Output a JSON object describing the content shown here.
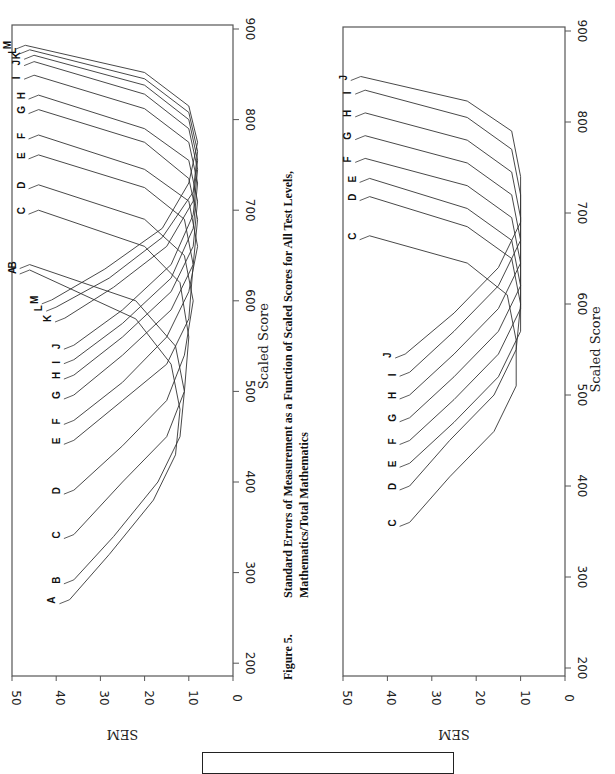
{
  "caption": {
    "figure_label": "Figure 5.",
    "line1": "Standard Errors of Measurement as a Function of Scaled Scores for All Test Levels,",
    "line2": "Mathematics/Total Mathematics"
  },
  "chart_data": [
    {
      "type": "line",
      "title": "Standard Errors of Measurement as a Function of Scaled Scores for All Test Levels, Mathematics/Total Mathematics (All levels A–M)",
      "xlabel": "Scaled Score",
      "ylabel": "SEM",
      "xlim": [
        200,
        900
      ],
      "ylim": [
        0,
        50
      ],
      "x_ticks": [
        200,
        300,
        400,
        500,
        600,
        700,
        800,
        900
      ],
      "y_ticks": [
        0,
        10,
        20,
        30,
        40,
        50
      ],
      "orientation": "rotated 90 degrees (page landscape)",
      "series": [
        {
          "name": "A",
          "x": [
            270,
            320,
            380,
            430,
            480,
            530,
            580,
            634
          ],
          "y": [
            37,
            28,
            18,
            13,
            12,
            14,
            22,
            46
          ]
        },
        {
          "name": "B",
          "x": [
            292,
            340,
            400,
            450,
            500,
            550,
            600,
            640
          ],
          "y": [
            36,
            27,
            17,
            12,
            11,
            13,
            22,
            46
          ]
        },
        {
          "name": "C",
          "x": [
            342,
            400,
            450,
            500,
            560,
            620,
            660,
            700
          ],
          "y": [
            36,
            25,
            15,
            11,
            10,
            12,
            20,
            44
          ]
        },
        {
          "name": "D",
          "x": [
            391,
            440,
            490,
            540,
            600,
            650,
            690,
            728
          ],
          "y": [
            36,
            25,
            15,
            11,
            9,
            11,
            20,
            44
          ]
        },
        {
          "name": "E",
          "x": [
            446,
            490,
            530,
            580,
            640,
            690,
            725,
            761
          ],
          "y": [
            36,
            25,
            15,
            10,
            9,
            11,
            20,
            44
          ]
        },
        {
          "name": "F",
          "x": [
            468,
            510,
            560,
            610,
            660,
            710,
            745,
            783
          ],
          "y": [
            36,
            25,
            15,
            10,
            8,
            10,
            20,
            44
          ]
        },
        {
          "name": "G",
          "x": [
            496,
            540,
            590,
            640,
            690,
            735,
            775,
            811
          ],
          "y": [
            36,
            25,
            14,
            9,
            8,
            10,
            20,
            44
          ]
        },
        {
          "name": "H",
          "x": [
            518,
            560,
            610,
            660,
            710,
            755,
            790,
            827
          ],
          "y": [
            36,
            25,
            14,
            9,
            8,
            10,
            20,
            44
          ]
        },
        {
          "name": "I",
          "x": [
            535,
            575,
            625,
            680,
            730,
            775,
            812,
            849
          ],
          "y": [
            36,
            25,
            14,
            9,
            8,
            10,
            20,
            45
          ]
        },
        {
          "name": "J",
          "x": [
            551,
            590,
            640,
            695,
            745,
            790,
            828,
            864
          ],
          "y": [
            36,
            25,
            14,
            9,
            8,
            10,
            20,
            45
          ]
        },
        {
          "name": "K",
          "x": [
            581,
            615,
            660,
            710,
            755,
            800,
            838,
            871
          ],
          "y": [
            38,
            27,
            15,
            9,
            8,
            10,
            20,
            45
          ]
        },
        {
          "name": "L",
          "x": [
            593,
            625,
            670,
            720,
            765,
            808,
            845,
            877
          ],
          "y": [
            40,
            28,
            16,
            9,
            8,
            10,
            20,
            46
          ]
        },
        {
          "name": "M",
          "x": [
            601,
            635,
            680,
            730,
            775,
            815,
            852,
            882
          ],
          "y": [
            41,
            29,
            16,
            10,
            8,
            10,
            20,
            47
          ]
        }
      ]
    },
    {
      "type": "line",
      "title": "SEM as a Function of Scaled Scores (Levels C–J)",
      "xlabel": "Scaled Score",
      "ylabel": "SEM",
      "xlim": [
        200,
        900
      ],
      "ylim": [
        0,
        50
      ],
      "x_ticks": [
        200,
        300,
        400,
        500,
        600,
        700,
        800,
        900
      ],
      "y_ticks": [
        0,
        10,
        20,
        30,
        40,
        50
      ],
      "series": [
        {
          "name": "C",
          "x": [
            360,
            410,
            460,
            510,
            560,
            610,
            645,
            675
          ],
          "y": [
            35,
            26,
            16,
            11,
            11,
            13,
            22,
            44
          ]
        },
        {
          "name": "D",
          "x": [
            400,
            450,
            500,
            550,
            600,
            650,
            685,
            718
          ],
          "y": [
            35,
            26,
            16,
            11,
            10,
            12,
            22,
            44
          ]
        },
        {
          "name": "E",
          "x": [
            425,
            470,
            520,
            570,
            620,
            670,
            705,
            738
          ],
          "y": [
            35,
            25,
            15,
            10,
            10,
            12,
            22,
            44
          ]
        },
        {
          "name": "F",
          "x": [
            450,
            495,
            545,
            595,
            645,
            695,
            730,
            760
          ],
          "y": [
            35,
            25,
            15,
            10,
            10,
            12,
            22,
            45
          ]
        },
        {
          "name": "G",
          "x": [
            475,
            520,
            570,
            620,
            670,
            720,
            755,
            785
          ],
          "y": [
            35,
            25,
            15,
            10,
            10,
            12,
            22,
            45
          ]
        },
        {
          "name": "H",
          "x": [
            500,
            545,
            595,
            645,
            695,
            745,
            780,
            810
          ],
          "y": [
            35,
            25,
            15,
            10,
            10,
            12,
            22,
            45
          ]
        },
        {
          "name": "I",
          "x": [
            525,
            570,
            620,
            670,
            720,
            770,
            805,
            835
          ],
          "y": [
            35,
            25,
            15,
            10,
            10,
            12,
            22,
            45
          ]
        },
        {
          "name": "J",
          "x": [
            545,
            590,
            640,
            690,
            740,
            790,
            823,
            850
          ],
          "y": [
            36,
            25,
            15,
            10,
            10,
            12,
            22,
            46
          ]
        }
      ]
    }
  ]
}
